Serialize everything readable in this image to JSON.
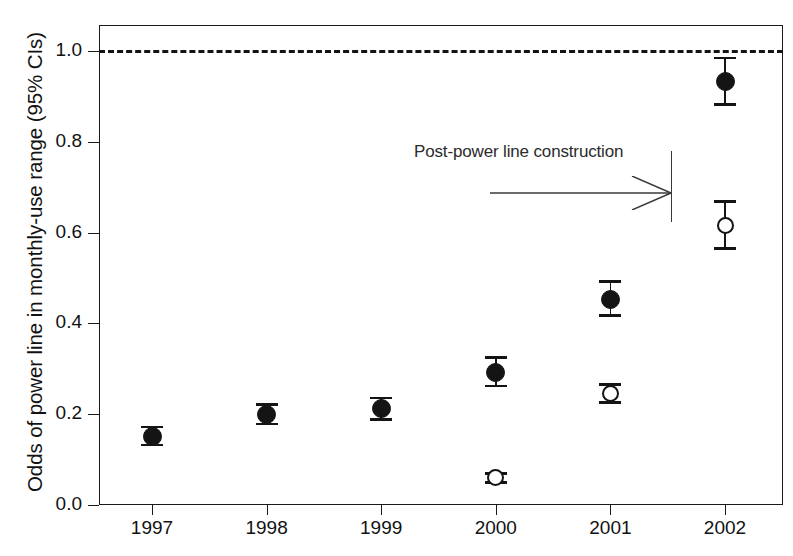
{
  "chart_data": {
    "type": "scatter",
    "title": "",
    "xlabel": "",
    "ylabel": "Odds of power line in monthly-use range (95% CIs)",
    "categories": [
      "1997",
      "1998",
      "1999",
      "2000",
      "2001",
      "2002"
    ],
    "xtick_labels": [
      "1997",
      "1998",
      "1999",
      "2000",
      "2001",
      "2002"
    ],
    "ytick_labels": [
      "0.0",
      "0.2",
      "0.4",
      "0.6",
      "0.8",
      "1.0"
    ],
    "ytick_values": [
      0.0,
      0.2,
      0.4,
      0.6,
      0.8,
      1.0
    ],
    "ylim": [
      0.0,
      1.06
    ],
    "grid": false,
    "legend": "none",
    "reference_line": {
      "value": 1.0,
      "style": "dashed",
      "label": ""
    },
    "annotations": [
      {
        "text": "Post-power line construction",
        "arrow": "right",
        "marks_boundary_year": "2002"
      }
    ],
    "series": [
      {
        "name": "filled-circles",
        "marker": "filled-circle",
        "points": [
          {
            "x": "1997",
            "value": 0.15,
            "ci_low": 0.132,
            "ci_high": 0.172
          },
          {
            "x": "1998",
            "value": 0.2,
            "ci_low": 0.178,
            "ci_high": 0.222
          },
          {
            "x": "1999",
            "value": 0.212,
            "ci_low": 0.188,
            "ci_high": 0.236
          },
          {
            "x": "2000",
            "value": 0.292,
            "ci_low": 0.262,
            "ci_high": 0.325
          },
          {
            "x": "2001",
            "value": 0.452,
            "ci_low": 0.418,
            "ci_high": 0.492
          },
          {
            "x": "2002",
            "value": 0.932,
            "ci_low": 0.882,
            "ci_high": 0.985
          }
        ]
      },
      {
        "name": "open-circles",
        "marker": "open-circle",
        "points": [
          {
            "x": "2000",
            "value": 0.06,
            "ci_low": 0.05,
            "ci_high": 0.07
          },
          {
            "x": "2001",
            "value": 0.245,
            "ci_low": 0.226,
            "ci_high": 0.266
          },
          {
            "x": "2002",
            "value": 0.615,
            "ci_low": 0.565,
            "ci_high": 0.668
          }
        ]
      }
    ]
  },
  "colors": {
    "axis": "#1a1a1a",
    "marker": "#141414",
    "annotation": "#2b2b2b",
    "background": "#ffffff"
  }
}
